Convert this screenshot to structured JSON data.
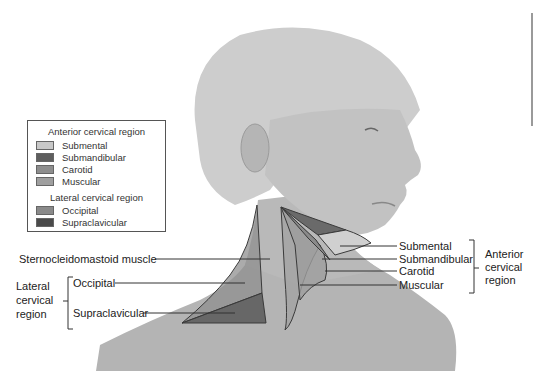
{
  "legend": {
    "anterior_title": "Anterior cervical region",
    "anterior_items": [
      {
        "label": "Submental",
        "color": "#c8c8c8"
      },
      {
        "label": "Submandibular",
        "color": "#5e5e5e"
      },
      {
        "label": "Carotid",
        "color": "#8e8e8e"
      },
      {
        "label": "Muscular",
        "color": "#9f9f9f"
      }
    ],
    "lateral_title": "Lateral cervical region",
    "lateral_items": [
      {
        "label": "Occipital",
        "color": "#8a8a8a"
      },
      {
        "label": "Supraclavicular",
        "color": "#4a4a4a"
      }
    ]
  },
  "labels": {
    "sternocleidomastoid": "Sternocleidomastoid muscle",
    "lateral_group": [
      "Lateral",
      "cervical",
      "region"
    ],
    "occipital": "Occipital",
    "supraclavicular": "Supraclavicular",
    "submental": "Submental",
    "submandibular": "Submandibular",
    "carotid": "Carotid",
    "muscular": "Muscular",
    "anterior_group": [
      "Anterior",
      "cervical",
      "region"
    ]
  },
  "colors": {
    "skin": "#b9b9b9",
    "skin_dark": "#a6a6a6",
    "hair": "#cfcfcf",
    "outline": "#3a3a3a"
  }
}
